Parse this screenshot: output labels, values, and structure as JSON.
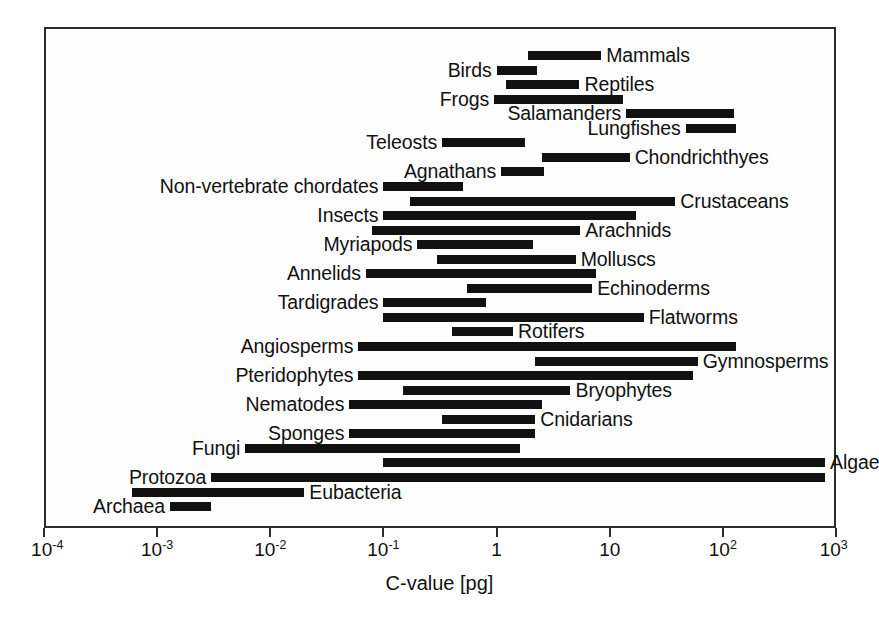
{
  "chart_data": {
    "type": "bar",
    "orientation": "horizontal-range",
    "title": "",
    "xlabel": "C-value [pg]",
    "ylabel": "",
    "xscale": "log",
    "xlim": [
      0.0001,
      1000
    ],
    "grid": false,
    "legend": "none",
    "xticks": [
      {
        "value": 0.0001,
        "mantissa": "10",
        "exponent": "-4",
        "label": "10^-4"
      },
      {
        "value": 0.001,
        "mantissa": "10",
        "exponent": "-3",
        "label": "10^-3"
      },
      {
        "value": 0.01,
        "mantissa": "10",
        "exponent": "-2",
        "label": "10^-2"
      },
      {
        "value": 0.1,
        "mantissa": "10",
        "exponent": "-1",
        "label": "10^-1"
      },
      {
        "value": 1,
        "mantissa": "1",
        "exponent": "",
        "label": "1"
      },
      {
        "value": 10,
        "mantissa": "10",
        "exponent": "",
        "label": "10"
      },
      {
        "value": 100,
        "mantissa": "10",
        "exponent": "2",
        "label": "10^2"
      },
      {
        "value": 1000,
        "mantissa": "10",
        "exponent": "3",
        "label": "10^3"
      }
    ],
    "bar_color": "#111111",
    "categories": [
      "Mammals",
      "Birds",
      "Reptiles",
      "Frogs",
      "Salamanders",
      "Lungfishes",
      "Teleosts",
      "Chondrichthyes",
      "Agnathans",
      "Non-vertebrate chordates",
      "Crustaceans",
      "Insects",
      "Arachnids",
      "Myriapods",
      "Molluscs",
      "Annelids",
      "Echinoderms",
      "Tardigrades",
      "Flatworms",
      "Rotifers",
      "Angiosperms",
      "Gymnosperms",
      "Pteridophytes",
      "Bryophytes",
      "Nematodes",
      "Cnidarians",
      "Sponges",
      "Fungi",
      "Algae",
      "Protozoa",
      "Eubacteria",
      "Archaea"
    ],
    "ranges": [
      {
        "name": "Mammals",
        "min": 1.9,
        "max": 8.4,
        "label_side": "right"
      },
      {
        "name": "Birds",
        "min": 1.0,
        "max": 2.3,
        "label_side": "left"
      },
      {
        "name": "Reptiles",
        "min": 1.2,
        "max": 5.4,
        "label_side": "right"
      },
      {
        "name": "Frogs",
        "min": 0.95,
        "max": 13.0,
        "label_side": "left"
      },
      {
        "name": "Salamanders",
        "min": 14.0,
        "max": 125.0,
        "label_side": "left"
      },
      {
        "name": "Lungfishes",
        "min": 47.0,
        "max": 132.0,
        "label_side": "left"
      },
      {
        "name": "Teleosts",
        "min": 0.33,
        "max": 1.8,
        "label_side": "left"
      },
      {
        "name": "Chondrichthyes",
        "min": 2.5,
        "max": 15.0,
        "label_side": "right"
      },
      {
        "name": "Agnathans",
        "min": 1.1,
        "max": 2.6,
        "label_side": "left"
      },
      {
        "name": "Non-vertebrate chordates",
        "min": 0.1,
        "max": 0.5,
        "label_side": "left"
      },
      {
        "name": "Crustaceans",
        "min": 0.17,
        "max": 38.0,
        "label_side": "right"
      },
      {
        "name": "Insects",
        "min": 0.1,
        "max": 17.0,
        "label_side": "left"
      },
      {
        "name": "Arachnids",
        "min": 0.08,
        "max": 5.5,
        "label_side": "right"
      },
      {
        "name": "Myriapods",
        "min": 0.2,
        "max": 2.1,
        "label_side": "left"
      },
      {
        "name": "Molluscs",
        "min": 0.3,
        "max": 5.0,
        "label_side": "right"
      },
      {
        "name": "Annelids",
        "min": 0.07,
        "max": 7.5,
        "label_side": "left"
      },
      {
        "name": "Echinoderms",
        "min": 0.55,
        "max": 7.0,
        "label_side": "right"
      },
      {
        "name": "Tardigrades",
        "min": 0.1,
        "max": 0.8,
        "label_side": "left"
      },
      {
        "name": "Flatworms",
        "min": 0.1,
        "max": 20.0,
        "label_side": "right"
      },
      {
        "name": "Rotifers",
        "min": 0.4,
        "max": 1.4,
        "label_side": "right"
      },
      {
        "name": "Angiosperms",
        "min": 0.06,
        "max": 130.0,
        "label_side": "left"
      },
      {
        "name": "Gymnosperms",
        "min": 2.2,
        "max": 60.0,
        "label_side": "right"
      },
      {
        "name": "Pteridophytes",
        "min": 0.06,
        "max": 55.0,
        "label_side": "left"
      },
      {
        "name": "Bryophytes",
        "min": 0.15,
        "max": 4.5,
        "label_side": "right"
      },
      {
        "name": "Nematodes",
        "min": 0.05,
        "max": 2.5,
        "label_side": "left"
      },
      {
        "name": "Cnidarians",
        "min": 0.33,
        "max": 2.2,
        "label_side": "right"
      },
      {
        "name": "Sponges",
        "min": 0.05,
        "max": 2.2,
        "label_side": "left"
      },
      {
        "name": "Fungi",
        "min": 0.006,
        "max": 1.6,
        "label_side": "left"
      },
      {
        "name": "Algae",
        "min": 0.1,
        "max": 800.0,
        "label_side": "right"
      },
      {
        "name": "Protozoa",
        "min": 0.003,
        "max": 800.0,
        "label_side": "left"
      },
      {
        "name": "Eubacteria",
        "min": 0.0006,
        "max": 0.02,
        "label_side": "right"
      },
      {
        "name": "Archaea",
        "min": 0.0013,
        "max": 0.003,
        "label_side": "left"
      }
    ]
  },
  "axis": {
    "x_title": "C-value [pg]"
  }
}
